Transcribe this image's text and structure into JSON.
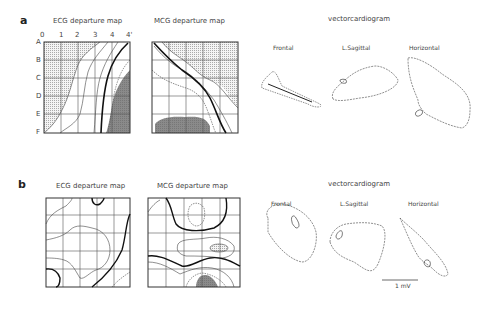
{
  "panels": [
    {
      "letter": "a",
      "ecg_title": "ECG departure map",
      "mcg_title": "MCG departure map",
      "vcg_title": "vectorcardiogram",
      "vcg_views": [
        "Frontal",
        "L.Sagittal",
        "Horizontal"
      ],
      "col_labels": [
        "0",
        "1",
        "2",
        "3",
        "4",
        "4'"
      ],
      "row_labels": [
        "A",
        "B",
        "C",
        "D",
        "E",
        "F"
      ]
    },
    {
      "letter": "b",
      "ecg_title": "ECG departure map",
      "mcg_title": "MCG departure map",
      "vcg_title": "vectorcardiogram",
      "vcg_views": [
        "Frontal",
        "L.Sagittal",
        "Horizontal"
      ],
      "scale_bar": "1 mV"
    }
  ]
}
